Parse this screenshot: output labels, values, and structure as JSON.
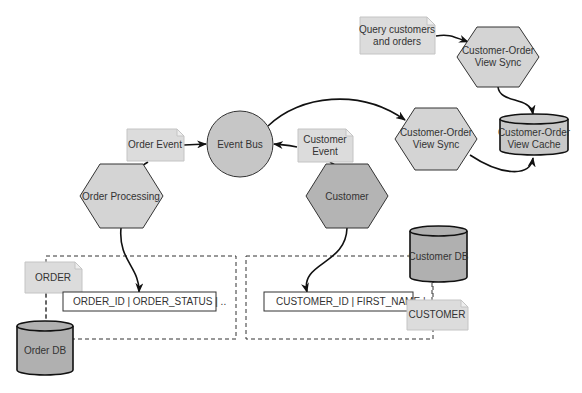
{
  "diagram": {
    "nodes": {
      "query_note": {
        "line1": "Query customers",
        "line2": "and orders",
        "shape": "note"
      },
      "view_sync_top": {
        "line1": "Customer-Order",
        "line2": "View Sync",
        "shape": "hexagon"
      },
      "view_sync_mid": {
        "line1": "Customer-Order",
        "line2": "View Sync",
        "shape": "hexagon"
      },
      "view_cache": {
        "line1": "Customer-Order",
        "line2": "View Cache",
        "shape": "cylinder"
      },
      "event_bus": {
        "label": "Event Bus",
        "shape": "circle"
      },
      "order_event": {
        "label": "Order Event",
        "shape": "note"
      },
      "customer_event": {
        "line1": "Customer",
        "line2": "Event",
        "shape": "note"
      },
      "order_processing": {
        "label": "Order Processing",
        "shape": "hexagon"
      },
      "customer": {
        "label": "Customer",
        "shape": "hexagon"
      },
      "customer_db": {
        "label": "Customer DB",
        "shape": "cylinder"
      },
      "order_note": {
        "label": "ORDER",
        "shape": "note"
      },
      "order_table_row": {
        "label": "ORDER_ID | ORDER_STATUS | .."
      },
      "order_db": {
        "label": "Order DB",
        "shape": "cylinder"
      },
      "customer_table_row": {
        "label": "CUSTOMER_ID | FIRST_NAME |"
      },
      "customer_note": {
        "label": "CUSTOMER",
        "shape": "note"
      }
    },
    "edges": [
      {
        "from": "Query customers and orders",
        "to": "Customer-Order View Sync (top)"
      },
      {
        "from": "Customer-Order View Sync (top)",
        "to": "Customer-Order View Cache"
      },
      {
        "from": "Event Bus",
        "to": "Customer-Order View Sync (middle)"
      },
      {
        "from": "Customer-Order View Sync (middle)",
        "to": "Customer-Order View Cache"
      },
      {
        "from": "Order Event",
        "to": "Event Bus"
      },
      {
        "from": "Customer Event",
        "to": "Event Bus"
      },
      {
        "from": "Order Processing",
        "to": "ORDER_ID | ORDER_STATUS | .."
      },
      {
        "from": "Customer",
        "to": "CUSTOMER_ID | FIRST_NAME |"
      }
    ]
  }
}
